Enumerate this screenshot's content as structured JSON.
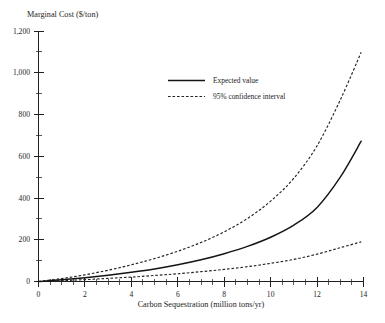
{
  "chart_data": {
    "type": "line",
    "title": "",
    "ylabel": "Marginal Cost ($/ton)",
    "xlabel": "Carbon Sequestration (million tons/yr)",
    "xlim": [
      0,
      14
    ],
    "ylim": [
      0,
      1200
    ],
    "grid": false,
    "legend_position": "upper-center",
    "x_tick_labels": [
      "0",
      "2",
      "4",
      "6",
      "8",
      "10",
      "12",
      "14"
    ],
    "x_ticks": [
      0,
      2,
      4,
      6,
      8,
      10,
      12,
      14
    ],
    "x_minor_tick_step": 0.5,
    "y_tick_labels": [
      "0",
      "200",
      "400",
      "600",
      "800",
      "1,000",
      "1,200"
    ],
    "y_ticks": [
      0,
      200,
      400,
      600,
      800,
      1000,
      1200
    ],
    "y_minor_tick_step": 100,
    "x": [
      0,
      1,
      2,
      3,
      4,
      5,
      6,
      7,
      8,
      9,
      10,
      11,
      12,
      13,
      13.9
    ],
    "series": [
      {
        "name": "Expected value",
        "style": "solid",
        "values": [
          0,
          8,
          18,
          30,
          44,
          60,
          80,
          104,
          133,
          168,
          212,
          270,
          355,
          500,
          672
        ]
      },
      {
        "name": "95% confidence interval",
        "style": "dashed",
        "bound": "upper",
        "values": [
          0,
          14,
          32,
          54,
          80,
          110,
          145,
          187,
          238,
          302,
          385,
          495,
          650,
          870,
          1098
        ]
      },
      {
        "name": "95% confidence interval",
        "style": "dashed",
        "bound": "lower",
        "values": [
          0,
          4,
          9,
          15,
          21,
          29,
          37,
          47,
          58,
          71,
          87,
          106,
          131,
          162,
          190
        ]
      }
    ],
    "legend": [
      {
        "label": "Expected value",
        "style": "solid"
      },
      {
        "label": "95% confidence interval",
        "style": "dashed"
      }
    ]
  }
}
